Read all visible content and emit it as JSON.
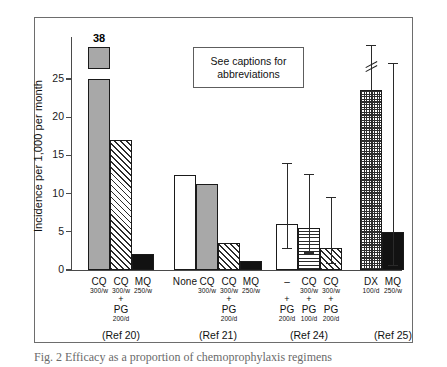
{
  "figure": {
    "note_box": "See captions for abbreviations",
    "caption": "Fig. 2   Efficacy as a proportion of chemoprophylaxis regimens"
  },
  "chart_data": {
    "type": "bar",
    "title": "",
    "xlabel": "",
    "ylabel": "Incidence per 1,000 per month",
    "ylim": [
      0,
      30
    ],
    "yticks": [
      0,
      5,
      10,
      15,
      20,
      25
    ],
    "ytick_labels": [
      "0",
      "5",
      "10",
      "15",
      "20",
      "25"
    ],
    "grid": false,
    "legend": "none",
    "axis_break": true,
    "categories": [
      "CQ 300/w",
      "CQ 300/w + PG 200/d",
      "MQ 250/w",
      "None",
      "CQ 300/w",
      "CQ 300/w + PG 200/d",
      "MQ 250/w",
      "- + PG 200/d",
      "CQ 300/w + PG 100/d",
      "CQ 300/w + PG 200/d",
      "DX 100/d",
      "MQ 250/w"
    ],
    "values": [
      38,
      17.0,
      2.1,
      12.4,
      11.2,
      3.5,
      1.2,
      6.0,
      5.5,
      2.9,
      23.6,
      5.0
    ],
    "errors_low": [
      null,
      null,
      null,
      null,
      null,
      null,
      null,
      2.9,
      2.3,
      0.9,
      7.5,
      0.7
    ],
    "errors_high": [
      null,
      null,
      null,
      null,
      null,
      null,
      null,
      14.0,
      12.6,
      9.6,
      29.5,
      27.1
    ],
    "bars": [
      {
        "group": 0,
        "label_drug": "CQ",
        "label_dose": "300/w",
        "plus": "",
        "label_drug2": "",
        "label_dose2": "",
        "value": 38,
        "display_value": "38",
        "fill": "grey",
        "broken": true,
        "x": 88,
        "w": 22
      },
      {
        "group": 0,
        "label_drug": "CQ",
        "label_dose": "300/w",
        "plus": "+",
        "label_drug2": "PG",
        "label_dose2": "200/d",
        "value": 17.0,
        "display_value": "",
        "fill": "diag",
        "broken": false,
        "x": 110,
        "w": 22
      },
      {
        "group": 0,
        "label_drug": "MQ",
        "label_dose": "250/w",
        "plus": "",
        "label_drug2": "",
        "label_dose2": "",
        "value": 2.1,
        "display_value": "",
        "fill": "black",
        "broken": false,
        "x": 132,
        "w": 22
      },
      {
        "group": 1,
        "label_drug": "None",
        "label_dose": "",
        "plus": "",
        "label_drug2": "",
        "label_dose2": "",
        "value": 12.4,
        "display_value": "",
        "fill": "white",
        "broken": false,
        "x": 174,
        "w": 22
      },
      {
        "group": 1,
        "label_drug": "CQ",
        "label_dose": "300/w",
        "plus": "",
        "label_drug2": "",
        "label_dose2": "",
        "value": 11.2,
        "display_value": "",
        "fill": "grey",
        "broken": false,
        "x": 196,
        "w": 22
      },
      {
        "group": 1,
        "label_drug": "CQ",
        "label_dose": "300/w",
        "plus": "+",
        "label_drug2": "PG",
        "label_dose2": "200/d",
        "value": 3.5,
        "display_value": "",
        "fill": "diag",
        "broken": false,
        "x": 218,
        "w": 22
      },
      {
        "group": 1,
        "label_drug": "MQ",
        "label_dose": "250/w",
        "plus": "",
        "label_drug2": "",
        "label_dose2": "",
        "value": 1.2,
        "display_value": "",
        "fill": "black",
        "broken": false,
        "x": 240,
        "w": 22
      },
      {
        "group": 2,
        "label_drug": "–",
        "label_dose": "",
        "plus": "+",
        "label_drug2": "PG",
        "label_dose2": "200/d",
        "value": 6.0,
        "display_value": "",
        "fill": "white",
        "broken": false,
        "x": 276,
        "w": 22
      },
      {
        "group": 2,
        "label_drug": "CQ",
        "label_dose": "300/w",
        "plus": "+",
        "label_drug2": "PG",
        "label_dose2": "100/d",
        "value": 5.5,
        "display_value": "",
        "fill": "horz",
        "broken": false,
        "x": 298,
        "w": 22
      },
      {
        "group": 2,
        "label_drug": "CQ",
        "label_dose": "300/w",
        "plus": "+",
        "label_drug2": "PG",
        "label_dose2": "200/d",
        "value": 2.9,
        "display_value": "",
        "fill": "diag",
        "broken": false,
        "x": 320,
        "w": 22
      },
      {
        "group": 3,
        "label_drug": "DX",
        "label_dose": "100/d",
        "plus": "",
        "label_drug2": "",
        "label_dose2": "",
        "value": 23.6,
        "display_value": "",
        "fill": "check",
        "broken": false,
        "x": 360,
        "w": 22
      },
      {
        "group": 3,
        "label_drug": "MQ",
        "label_dose": "250/w",
        "plus": "",
        "label_drug2": "",
        "label_dose2": "",
        "value": 5.0,
        "display_value": "",
        "fill": "black",
        "broken": false,
        "x": 382,
        "w": 22
      }
    ],
    "groups": [
      {
        "ref": "(Ref 20)",
        "cx": 121
      },
      {
        "ref": "(Ref 21)",
        "cx": 218
      },
      {
        "ref": "(Ref 24)",
        "cx": 309
      },
      {
        "ref": "(Ref 25)",
        "cx": 393
      }
    ]
  }
}
